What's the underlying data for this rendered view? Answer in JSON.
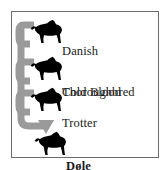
{
  "figure": {
    "frame_color": "#6b6b6b",
    "background_color": "#ffffff",
    "arrow_color": "#9a9a9a",
    "silhouette_color": "#000000",
    "text_color": "#1b1b1b"
  },
  "entries": [
    {
      "id": "danish-cold-blood",
      "label_line1": "Danish",
      "label_line2": "Cold Blood",
      "icon": "horse-silhouette-icon",
      "role": "parent"
    },
    {
      "id": "thoroughbred",
      "label_line1": "Thoroughbred",
      "label_line2": "",
      "icon": "horse-silhouette-icon",
      "role": "parent"
    },
    {
      "id": "trotter",
      "label_line1": "Trotter",
      "label_line2": "",
      "icon": "horse-silhouette-icon",
      "role": "parent"
    },
    {
      "id": "dole",
      "label_line1": "Døle",
      "label_line2": "",
      "icon": "horse-silhouette-icon",
      "role": "result"
    }
  ],
  "connector": {
    "name": "merge-arrow",
    "description": "Three bracket hooks merge into a vertical trunk that curves right and terminates in a downward arrowhead at the result horse",
    "hook_count": 3,
    "arrowhead": "down"
  }
}
